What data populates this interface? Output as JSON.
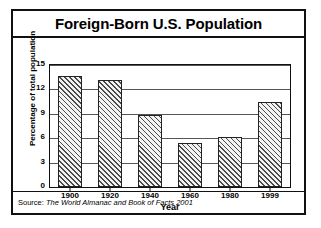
{
  "figure": {
    "title": "Foreign-Born U.S. Population",
    "source_prefix": "Source: ",
    "source": "The World Almanac and Book of Facts 2001",
    "border_color": "#111111",
    "bar_hatch_color": "#4a4a4a",
    "gridline_color": "#555555"
  },
  "chart_data": {
    "type": "bar",
    "title": "Foreign-Born U.S. Population",
    "xlabel": "Year",
    "ylabel": "Percentage of total population",
    "categories": [
      "1900",
      "1920",
      "1940",
      "1960",
      "1980",
      "1999"
    ],
    "values": [
      13.6,
      13.2,
      8.8,
      5.4,
      6.2,
      10.4
    ],
    "ylim": [
      0,
      15
    ],
    "yticks": [
      0,
      3,
      6,
      9,
      12,
      15
    ],
    "ytick_labels": [
      "0",
      "3",
      "6",
      "9",
      "12",
      "15"
    ],
    "grid": true,
    "legend": "none",
    "series": [
      {
        "name": "Percentage of total population",
        "values": [
          13.6,
          13.2,
          8.8,
          5.4,
          6.2,
          10.4
        ]
      }
    ]
  }
}
